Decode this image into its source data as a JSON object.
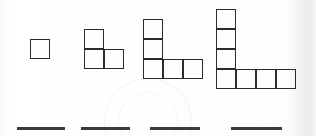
{
  "worksheet": {
    "type": "growing-pattern-squares",
    "description": "Sequence of four L-shaped figures made of unit squares with four blank answer lines below",
    "cell_size_px": 20,
    "stroke_color": "#2b2b2b",
    "answer_line_color": "#3a3a3a",
    "background_color": "#fdfdfc",
    "figures": [
      {
        "name": "figure-1",
        "square_count": 1,
        "grid_cols": 1,
        "grid_rows": 1,
        "x": 30,
        "y": 39,
        "cells": [
          {
            "col": 0,
            "row": 0
          }
        ]
      },
      {
        "name": "figure-2",
        "square_count": 3,
        "grid_cols": 2,
        "grid_rows": 2,
        "x": 84,
        "y": 29,
        "cells": [
          {
            "col": 0,
            "row": 0
          },
          {
            "col": 0,
            "row": 1
          },
          {
            "col": 1,
            "row": 1
          }
        ]
      },
      {
        "name": "figure-3",
        "square_count": 5,
        "grid_cols": 3,
        "grid_rows": 3,
        "x": 143,
        "y": 19,
        "cells": [
          {
            "col": 0,
            "row": 0
          },
          {
            "col": 0,
            "row": 1
          },
          {
            "col": 0,
            "row": 2
          },
          {
            "col": 1,
            "row": 2
          },
          {
            "col": 2,
            "row": 2
          }
        ]
      },
      {
        "name": "figure-4",
        "square_count": 7,
        "grid_cols": 4,
        "grid_rows": 4,
        "x": 216,
        "y": 9,
        "cells": [
          {
            "col": 0,
            "row": 0
          },
          {
            "col": 0,
            "row": 1
          },
          {
            "col": 0,
            "row": 2
          },
          {
            "col": 0,
            "row": 3
          },
          {
            "col": 1,
            "row": 3
          },
          {
            "col": 2,
            "row": 3
          },
          {
            "col": 3,
            "row": 3
          }
        ]
      }
    ],
    "answer_lines": [
      {
        "name": "answer-line-1",
        "x": 17,
        "y": 127,
        "width": 48,
        "value": ""
      },
      {
        "name": "answer-line-2",
        "x": 81,
        "y": 127,
        "width": 49,
        "value": ""
      },
      {
        "name": "answer-line-3",
        "x": 150,
        "y": 127,
        "width": 50,
        "value": ""
      },
      {
        "name": "answer-line-4",
        "x": 231,
        "y": 127,
        "width": 51,
        "value": ""
      }
    ]
  }
}
